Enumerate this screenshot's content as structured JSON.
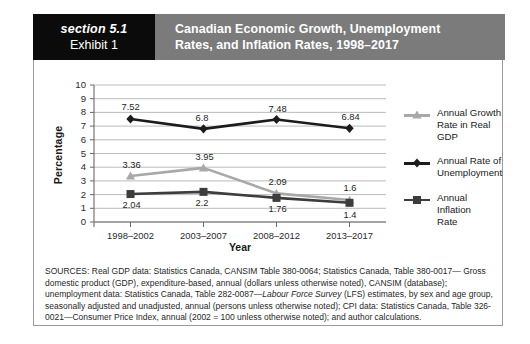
{
  "header": {
    "section_label": "section 5.1",
    "exhibit_label": "Exhibit 1",
    "title_line1": "Canadian Economic Growth, Unemployment",
    "title_line2": "Rates, and Inflation Rates, 1998–2017",
    "band_color": "#7b7b7b",
    "block_color": "#0b0b0b"
  },
  "chart_data": {
    "type": "line",
    "title": "Canadian Economic Growth, Unemployment Rates, and Inflation Rates, 1998–2017",
    "xlabel": "Year",
    "ylabel": "Percentage",
    "categories": [
      "1998–2002",
      "2003–2007",
      "2008–2012",
      "2013–2017"
    ],
    "ylim": [
      0,
      10
    ],
    "yticks": [
      "10",
      "9",
      "8",
      "7",
      "6",
      "5",
      "4",
      "3",
      "2",
      "1",
      "0"
    ],
    "grid": true,
    "legend_position": "right",
    "series": [
      {
        "name": "Annual Growth\nRate in Real GDP",
        "color": "#a8a8a8",
        "marker": "triangle",
        "values": [
          3.36,
          3.95,
          2.09,
          1.6
        ],
        "labels": [
          "3.36",
          "3.95",
          "2.09",
          "1.6"
        ]
      },
      {
        "name": "Annual Rate of\nUnemployment",
        "color": "#1c1c1c",
        "marker": "diamond",
        "values": [
          7.52,
          6.8,
          7.48,
          6.84
        ],
        "labels": [
          "7.52",
          "6.8",
          "7.48",
          "6.84"
        ]
      },
      {
        "name": "Annual Inflation\nRate",
        "color": "#3d3d3d",
        "marker": "square",
        "values": [
          2.04,
          2.2,
          1.76,
          1.4
        ],
        "labels": [
          "2.04",
          "2.2",
          "1.76",
          "1.4"
        ]
      }
    ]
  },
  "sources": {
    "line1": "SOURCES: Real GDP data: Statistics Canada, CANSIM Table 380-0064; Statistics Canada, Table 380-0017—",
    "line2": "Gross domestic product (GDP), expenditure-based, annual (dollars unless otherwise noted), CANSIM (database);",
    "line3a": "unemployment data: Statistics Canada, Table 282-0087—",
    "line3b": "Labour Force Survey",
    "line3c": " (LFS) estimates, by sex and age",
    "line4": "group, seasonally adjusted and unadjusted, annual (persons unless otherwise noted); CPI data: Statistics Canada,",
    "line5": "Table 326-0021—Consumer Price Index, annual (2002 = 100 unless otherwise noted); and author calculations."
  }
}
